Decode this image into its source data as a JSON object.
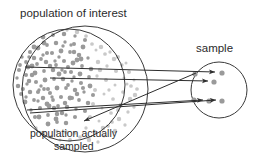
{
  "diagram": {
    "title_label": "population of interest",
    "inner_label_line1": "population actually",
    "inner_label_line2": "sampled",
    "sample_label": "sample",
    "colors": {
      "outline": "#3a3a3a",
      "text": "#2b2b2b",
      "arrow": "#2e2e2e",
      "dot_dark": "#9a9a9a",
      "dot_light": "#c9c9c9",
      "sample_dot": "#9a9a9a",
      "background": "#ffffff"
    },
    "shapes": {
      "outer_circle": {
        "cx": 85,
        "cy": 89,
        "r": 63,
        "name": "population-of-interest-circle"
      },
      "inner_circle": {
        "cx": 69,
        "cy": 85,
        "r": 56,
        "name": "population-actually-sampled-circle"
      },
      "sample_circle": {
        "cx": 219,
        "cy": 90,
        "r": 28,
        "name": "sample-circle"
      }
    },
    "sample_dots": [
      {
        "cx": 222,
        "cy": 73
      },
      {
        "cx": 214,
        "cy": 82
      },
      {
        "cx": 209,
        "cy": 101
      },
      {
        "cx": 222,
        "cy": 101
      },
      {
        "cx": 195,
        "cy": 74
      },
      {
        "cx": 194,
        "cy": 100
      }
    ],
    "arrows": [
      {
        "x1": 25,
        "y1": 67,
        "x2": 215,
        "y2": 72,
        "name": "sampling-arrow-1"
      },
      {
        "x1": 50,
        "y1": 78,
        "x2": 208,
        "y2": 81,
        "name": "sampling-arrow-2"
      },
      {
        "x1": 27,
        "y1": 110,
        "x2": 203,
        "y2": 100,
        "name": "sampling-arrow-3"
      },
      {
        "x1": 30,
        "y1": 113,
        "x2": 216,
        "y2": 100,
        "name": "sampling-arrow-4"
      },
      {
        "x1": 196,
        "y1": 73,
        "x2": 84,
        "y2": 121,
        "name": "sampling-arrow-5"
      }
    ],
    "population_dots_dark": [
      [
        22,
        57
      ],
      [
        30,
        52
      ],
      [
        38,
        48
      ],
      [
        47,
        45
      ],
      [
        56,
        43
      ],
      [
        65,
        42
      ],
      [
        74,
        44
      ],
      [
        83,
        47
      ],
      [
        26,
        62
      ],
      [
        34,
        58
      ],
      [
        43,
        55
      ],
      [
        52,
        53
      ],
      [
        61,
        51
      ],
      [
        70,
        52
      ],
      [
        79,
        55
      ],
      [
        88,
        58
      ],
      [
        19,
        70
      ],
      [
        28,
        67
      ],
      [
        37,
        64
      ],
      [
        46,
        62
      ],
      [
        55,
        61
      ],
      [
        64,
        61
      ],
      [
        73,
        63
      ],
      [
        82,
        66
      ],
      [
        91,
        69
      ],
      [
        17,
        78
      ],
      [
        26,
        75
      ],
      [
        35,
        73
      ],
      [
        44,
        71
      ],
      [
        53,
        70
      ],
      [
        62,
        70
      ],
      [
        71,
        72
      ],
      [
        80,
        74
      ],
      [
        89,
        77
      ],
      [
        18,
        86
      ],
      [
        27,
        84
      ],
      [
        36,
        82
      ],
      [
        45,
        80
      ],
      [
        54,
        79
      ],
      [
        63,
        79
      ],
      [
        72,
        81
      ],
      [
        81,
        83
      ],
      [
        90,
        86
      ],
      [
        21,
        94
      ],
      [
        30,
        92
      ],
      [
        39,
        90
      ],
      [
        48,
        89
      ],
      [
        57,
        88
      ],
      [
        66,
        88
      ],
      [
        75,
        90
      ],
      [
        84,
        92
      ],
      [
        93,
        95
      ],
      [
        25,
        102
      ],
      [
        34,
        100
      ],
      [
        43,
        98
      ],
      [
        52,
        97
      ],
      [
        61,
        97
      ],
      [
        70,
        98
      ],
      [
        79,
        100
      ],
      [
        88,
        103
      ],
      [
        31,
        110
      ],
      [
        40,
        108
      ],
      [
        49,
        106
      ],
      [
        58,
        106
      ],
      [
        67,
        107
      ],
      [
        76,
        109
      ],
      [
        85,
        111
      ],
      [
        39,
        117
      ],
      [
        48,
        115
      ],
      [
        57,
        114
      ],
      [
        66,
        115
      ],
      [
        75,
        117
      ],
      [
        48,
        124
      ],
      [
        57,
        122
      ],
      [
        66,
        123
      ],
      [
        24,
        48
      ],
      [
        33,
        41
      ],
      [
        43,
        37
      ],
      [
        53,
        35
      ],
      [
        64,
        34
      ],
      [
        75,
        36
      ],
      [
        85,
        40
      ],
      [
        32,
        66
      ],
      [
        41,
        59
      ],
      [
        50,
        66
      ],
      [
        59,
        57
      ],
      [
        68,
        67
      ],
      [
        77,
        60
      ],
      [
        23,
        89
      ],
      [
        32,
        75
      ],
      [
        41,
        86
      ],
      [
        50,
        93
      ],
      [
        59,
        74
      ],
      [
        68,
        85
      ],
      [
        77,
        94
      ],
      [
        29,
        57
      ],
      [
        38,
        92
      ],
      [
        47,
        104
      ],
      [
        56,
        65
      ],
      [
        65,
        103
      ],
      [
        74,
        77
      ],
      [
        83,
        88
      ],
      [
        34,
        47
      ],
      [
        44,
        89
      ],
      [
        54,
        108
      ],
      [
        63,
        46
      ],
      [
        72,
        98
      ],
      [
        81,
        59
      ],
      [
        20,
        65
      ],
      [
        29,
        81
      ],
      [
        38,
        101
      ],
      [
        47,
        53
      ],
      [
        56,
        119
      ],
      [
        65,
        72
      ],
      [
        74,
        52
      ],
      [
        26,
        97
      ],
      [
        35,
        117
      ],
      [
        44,
        43
      ],
      [
        53,
        100
      ],
      [
        62,
        113
      ],
      [
        71,
        45
      ]
    ],
    "population_dots_light": [
      [
        96,
        50
      ],
      [
        105,
        54
      ],
      [
        114,
        59
      ],
      [
        122,
        65
      ],
      [
        129,
        72
      ],
      [
        134,
        80
      ],
      [
        137,
        89
      ],
      [
        98,
        62
      ],
      [
        107,
        66
      ],
      [
        116,
        71
      ],
      [
        124,
        78
      ],
      [
        131,
        86
      ],
      [
        135,
        95
      ],
      [
        97,
        76
      ],
      [
        106,
        80
      ],
      [
        115,
        85
      ],
      [
        123,
        92
      ],
      [
        130,
        99
      ],
      [
        134,
        107
      ],
      [
        95,
        90
      ],
      [
        104,
        94
      ],
      [
        113,
        99
      ],
      [
        121,
        105
      ],
      [
        128,
        112
      ],
      [
        93,
        104
      ],
      [
        102,
        108
      ],
      [
        111,
        113
      ],
      [
        119,
        119
      ],
      [
        125,
        125
      ],
      [
        90,
        117
      ],
      [
        99,
        121
      ],
      [
        108,
        126
      ],
      [
        115,
        131
      ],
      [
        86,
        128
      ],
      [
        95,
        132
      ],
      [
        104,
        136
      ],
      [
        92,
        44
      ],
      [
        101,
        47
      ],
      [
        110,
        52
      ],
      [
        118,
        57
      ],
      [
        126,
        63
      ],
      [
        80,
        137
      ],
      [
        89,
        140
      ],
      [
        98,
        142
      ],
      [
        70,
        140
      ],
      [
        60,
        140
      ],
      [
        51,
        137
      ],
      [
        43,
        133
      ],
      [
        36,
        128
      ],
      [
        30,
        122
      ],
      [
        25,
        116
      ],
      [
        21,
        109
      ],
      [
        100,
        70
      ],
      [
        109,
        90
      ],
      [
        118,
        110
      ],
      [
        127,
        84
      ],
      [
        112,
        122
      ],
      [
        103,
        128
      ],
      [
        75,
        133
      ],
      [
        66,
        132
      ],
      [
        57,
        131
      ],
      [
        86,
        36
      ],
      [
        77,
        32
      ],
      [
        67,
        30
      ],
      [
        57,
        31
      ]
    ]
  }
}
